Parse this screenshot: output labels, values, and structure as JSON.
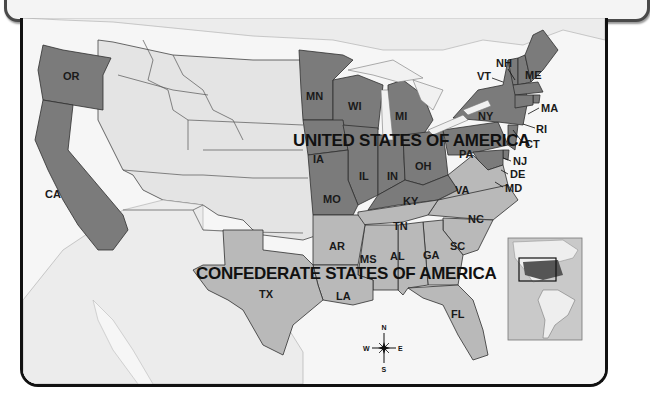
{
  "title": "CIVIL WAR",
  "map": {
    "region_labels": {
      "union": "UNITED STATES OF AMERICA",
      "confederacy": "CONFEDERATE STATES OF AMERICA"
    },
    "colors": {
      "union": "#7b7b7b",
      "confederacy": "#b9b9b9",
      "territory": "#e4e4e4",
      "water": "#f6f6f6",
      "border": "#3a3a3a"
    },
    "union_states": [
      "OR",
      "CA",
      "MN",
      "WI",
      "MI",
      "IA",
      "IL",
      "IN",
      "OH",
      "MO",
      "KY",
      "PA",
      "NY",
      "VT",
      "NH",
      "ME",
      "MA",
      "RI",
      "CT",
      "NJ",
      "DE",
      "MD"
    ],
    "confederate_states": [
      "TX",
      "AR",
      "LA",
      "MS",
      "AL",
      "TN",
      "GA",
      "SC",
      "NC",
      "VA",
      "FL"
    ],
    "state_labels": {
      "OR": "OR",
      "CA": "CA",
      "MN": "MN",
      "WI": "WI",
      "MI": "MI",
      "IA": "IA",
      "IL": "IL",
      "IN": "IN",
      "OH": "OH",
      "MO": "MO",
      "KY": "KY",
      "PA": "PA",
      "NY": "NY",
      "VT": "VT",
      "NH": "NH",
      "ME": "ME",
      "MA": "MA",
      "RI": "RI",
      "CT": "CT",
      "NJ": "NJ",
      "DE": "DE",
      "MD": "MD",
      "VA": "VA",
      "NC": "NC",
      "SC": "SC",
      "TN": "TN",
      "GA": "GA",
      "AL": "AL",
      "MS": "MS",
      "AR": "AR",
      "LA": "LA",
      "TX": "TX",
      "FL": "FL"
    },
    "compass": {
      "n": "N",
      "s": "S",
      "e": "E",
      "w": "W"
    },
    "inset": {
      "description": "locator map of the Americas with USA highlighted"
    }
  }
}
